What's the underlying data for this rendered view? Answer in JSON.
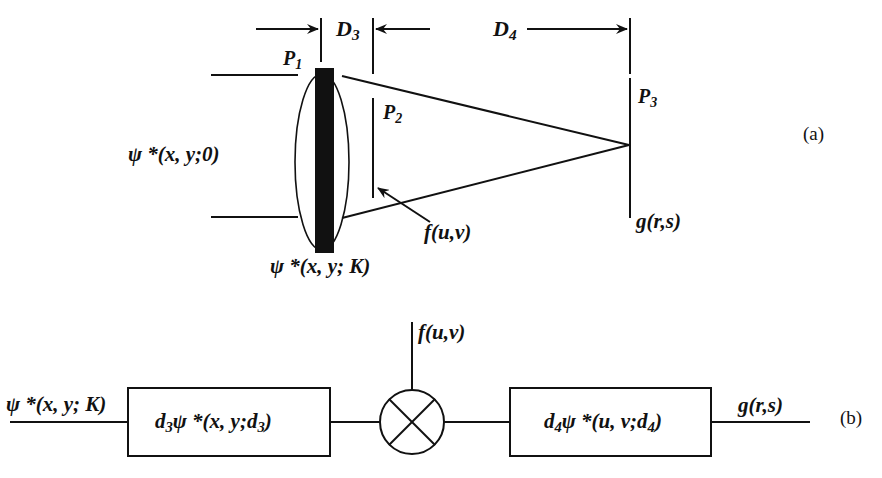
{
  "diagram": {
    "part_a": {
      "tag": "(a)",
      "distances": {
        "d3": "D",
        "d3_sub": "3",
        "d4": "D",
        "d4_sub": "4"
      },
      "planes": {
        "p1": "P",
        "p1_sub": "1",
        "p2": "P",
        "p2_sub": "2",
        "p3": "P",
        "p3_sub": "3"
      },
      "input_label": "ψ *(x, y;0)",
      "lens_label": "ψ *(x, y; K)",
      "mask_label": "f(u,v)",
      "output_label": "g(r,s)"
    },
    "part_b": {
      "tag": "(b)",
      "input_label": "ψ *(x, y; K)",
      "block1": {
        "prefix": "d",
        "prefix_sub": "3",
        "body": "ψ *(x, y;d",
        "body_sub": "3",
        "close": ")"
      },
      "multiplier_input": "f(u,v)",
      "block2": {
        "prefix": "d",
        "prefix_sub": "4",
        "body": "ψ *(u, v;d",
        "body_sub": "4",
        "close": ")"
      },
      "output_label": "g(r,s)"
    },
    "colors": {
      "ink": "#111111",
      "background": "#ffffff"
    }
  }
}
